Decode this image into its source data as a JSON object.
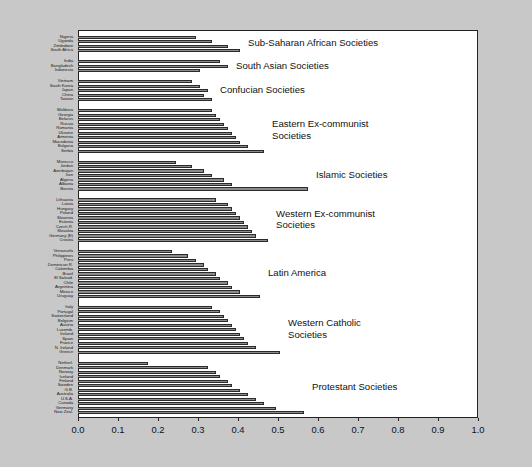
{
  "chart_data": {
    "type": "bar",
    "orientation": "horizontal",
    "title": "",
    "xlabel": "",
    "ylabel": "",
    "xlim": [
      0.0,
      1.0
    ],
    "xticks": [
      "0.0",
      "0.1",
      "0.2",
      "0.3",
      "0.4",
      "0.5",
      "0.6",
      "0.7",
      "0.8",
      "0.9",
      "1.0"
    ],
    "xtick_values": [
      0.0,
      0.1,
      0.2,
      0.3,
      0.4,
      0.5,
      0.6,
      0.7,
      0.8,
      0.9,
      1.0
    ],
    "grid": false,
    "legend": "none",
    "bar_fill_color": "#8a8a8a",
    "bar_edge_color": "#2b2b2b",
    "plot_background": "#ffffff",
    "figure_background": "#c8c8c8",
    "groups": [
      {
        "label": "Sub-Saharan African Societies",
        "categories": [
          "Nigeria",
          "Uganda",
          "Zimbabwe",
          "South Africa"
        ],
        "values": [
          0.295,
          0.335,
          0.375,
          0.405
        ]
      },
      {
        "label": "South Asian Societies",
        "categories": [
          "India",
          "Bangladesh",
          "Indonesia"
        ],
        "values": [
          0.355,
          0.375,
          0.305
        ]
      },
      {
        "label": "Confucian Societies",
        "categories": [
          "Vietnam",
          "South Korea",
          "Japan",
          "China",
          "Taiwan"
        ],
        "values": [
          0.285,
          0.305,
          0.325,
          0.315,
          0.335
        ]
      },
      {
        "label": "Eastern Ex-communist\nSocieties",
        "categories": [
          "Moldova",
          "Georgia",
          "Belarus",
          "Russia",
          "Romania",
          "Ukraine",
          "Armenia",
          "Macedonia",
          "Bulgaria",
          "Serbia"
        ],
        "values": [
          0.335,
          0.345,
          0.355,
          0.365,
          0.375,
          0.385,
          0.395,
          0.405,
          0.425,
          0.465
        ]
      },
      {
        "label": "Islamic Societies",
        "categories": [
          "Morocco",
          "Jordan",
          "Azerbaijan",
          "Iran",
          "Algeria",
          "Albania",
          "Bosnia"
        ],
        "values": [
          0.245,
          0.285,
          0.315,
          0.335,
          0.365,
          0.385,
          0.575
        ]
      },
      {
        "label": "Western Ex-communist\nSocieties",
        "categories": [
          "Lithuania",
          "Latvia",
          "Hungary",
          "Poland",
          "Slovenia",
          "Estonia",
          "Czech R.",
          "Slovakia",
          "Germany (E)",
          "Croatia"
        ],
        "values": [
          0.345,
          0.375,
          0.385,
          0.395,
          0.405,
          0.415,
          0.425,
          0.435,
          0.445,
          0.475
        ]
      },
      {
        "label": "Latin America",
        "categories": [
          "Venezuela",
          "Philippines",
          "Peru",
          "Dominican R.",
          "Colombia",
          "Brazil",
          "El Salvad.",
          "Chile",
          "Argentina",
          "Mexico",
          "Uruguay"
        ],
        "values": [
          0.235,
          0.275,
          0.295,
          0.315,
          0.325,
          0.345,
          0.355,
          0.375,
          0.385,
          0.405,
          0.455
        ]
      },
      {
        "label": "Western Catholic\nSocieties",
        "categories": [
          "Italy",
          "Portugal",
          "Switzerland",
          "Belgium",
          "Austria",
          "Luxemb.",
          "Ireland",
          "Spain",
          "France",
          "N. Ireland",
          "Greece"
        ],
        "values": [
          0.335,
          0.355,
          0.365,
          0.375,
          0.385,
          0.395,
          0.405,
          0.415,
          0.425,
          0.445,
          0.505
        ]
      },
      {
        "label": "Protestant Societies",
        "categories": [
          "Netherl.",
          "Denmark",
          "Norway",
          "Iceland",
          "Finland",
          "Sweden",
          "G.B.",
          "Australia",
          "U.S.A.",
          "Canada",
          "Germany",
          "New Zeal."
        ],
        "values": [
          0.175,
          0.325,
          0.345,
          0.355,
          0.375,
          0.385,
          0.405,
          0.425,
          0.445,
          0.465,
          0.495,
          0.565
        ]
      }
    ]
  }
}
